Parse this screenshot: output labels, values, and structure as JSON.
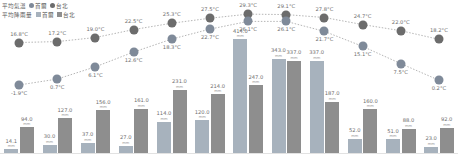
{
  "legend": {
    "temp_title": "平均氣溫",
    "rain_title": "平均降雨量",
    "seoul": "首爾",
    "taipei": "台北"
  },
  "colors": {
    "seoul_temp_dot": "#7f8a99",
    "taipei_temp_dot": "#6c6c6c",
    "seoul_bar": "#a7b2bd",
    "taipei_bar": "#8e8e8e",
    "line": "#b6b6b6",
    "label": "#6e6e6e",
    "unit": "#9a9a9a"
  },
  "units": {
    "temp": "°C",
    "rain": "mm"
  },
  "chart_data": {
    "type": "bar",
    "xlabel": "",
    "ylabel": "",
    "categories": [
      "1",
      "2",
      "3",
      "4",
      "5",
      "6",
      "7",
      "8",
      "9",
      "10",
      "11",
      "12"
    ],
    "ylim": [
      0,
      420
    ],
    "temp_ylim": [
      -5,
      32
    ],
    "grid": false,
    "legend_position": "top-left",
    "series": [
      {
        "name": "平均氣溫 台北",
        "type": "line",
        "unit": "°C",
        "values": [
          16.8,
          17.2,
          19.0,
          22.5,
          25.3,
          27.5,
          29.3,
          29.1,
          27.8,
          24.7,
          22.0,
          18.2
        ],
        "labels": [
          "16.8°C",
          "17.2°C",
          "19.0°C",
          "22.5°C",
          "25.3°C",
          "27.5°C",
          "29.3°C",
          "29.1°C",
          "27.8°C",
          "24.7°C",
          "22.0°C",
          "18.2°C"
        ]
      },
      {
        "name": "平均氣溫 首爾",
        "type": "line",
        "unit": "°C",
        "values": [
          -1.9,
          0.7,
          6.1,
          12.6,
          18.3,
          22.7,
          26.1,
          26.1,
          21.7,
          15.1,
          7.5,
          0.2
        ],
        "labels": [
          "-1.9°C",
          "0.7°C",
          "6.1°C",
          "12.6°C",
          "18.3°C",
          "22.7°C",
          "26.1°C",
          "26.1°C",
          "21.7°C",
          "15.1°C",
          "7.5°C",
          "0.2°C"
        ]
      },
      {
        "name": "平均降雨量 首爾",
        "type": "bar",
        "unit": "mm",
        "values": [
          14.1,
          30.0,
          37.0,
          27.0,
          114.0,
          120.0,
          414.0,
          343.0,
          337.0,
          52.0,
          51.0,
          23.0
        ],
        "labels": [
          "14.1",
          "30.0",
          "37.0",
          "27.0",
          "114.0",
          "120.0",
          "414.0",
          "343.0",
          "337.0",
          "52.0",
          "51.0",
          "23.0"
        ]
      },
      {
        "name": "平均降雨量 台北",
        "type": "bar",
        "unit": "mm",
        "values": [
          94.0,
          127.0,
          156.0,
          161.0,
          231.0,
          214.0,
          247.0,
          337.0,
          187.0,
          160.0,
          88.0,
          92.0
        ],
        "labels": [
          "94.0",
          "127.0",
          "156.0",
          "161.0",
          "231.0",
          "214.0",
          "247.0",
          "337.0",
          "187.0",
          "160.0",
          "88.0",
          "92.0"
        ]
      }
    ]
  }
}
